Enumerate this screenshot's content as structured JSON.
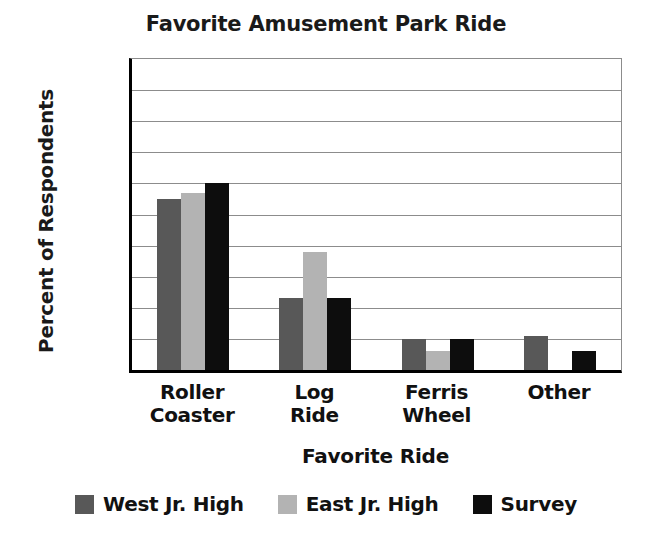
{
  "chart_data": {
    "type": "bar",
    "title": "Favorite Amusement Park Ride",
    "xlabel": "Favorite Ride",
    "ylabel": "Percent of Respondents",
    "categories": [
      "Roller Coaster",
      "Log Ride",
      "Ferris Wheel",
      "Other"
    ],
    "category_lines": [
      [
        "Roller",
        "Coaster"
      ],
      [
        "Log",
        "Ride"
      ],
      [
        "Ferris",
        "Wheel"
      ],
      [
        "Other"
      ]
    ],
    "series": [
      {
        "name": "West Jr. High",
        "color": "#585858",
        "values": [
          55,
          23,
          10,
          11
        ]
      },
      {
        "name": "East Jr. High",
        "color": "#b3b3b3",
        "values": [
          57,
          38,
          6,
          0
        ]
      },
      {
        "name": "Survey",
        "color": "#0d0d0d",
        "values": [
          60,
          23,
          10,
          6
        ]
      }
    ],
    "ylim": [
      0,
      100
    ],
    "ytick_values": [
      0,
      10,
      30,
      50,
      70,
      90
    ],
    "ytick_labels": [
      "0%",
      "10%",
      "30%",
      "50%",
      "70%",
      "90%"
    ],
    "gridline_values": [
      10,
      20,
      30,
      40,
      50,
      60,
      70,
      80,
      90
    ],
    "grid": true,
    "legend_position": "bottom"
  }
}
